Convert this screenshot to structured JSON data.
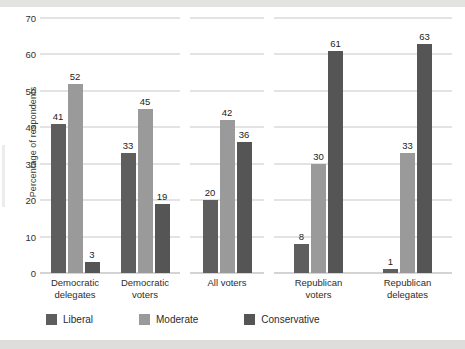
{
  "chart_data": {
    "type": "bar",
    "title": "",
    "xlabel": "",
    "ylabel": "Percentage of respondents",
    "ylim": [
      0,
      70
    ],
    "yticks": [
      0,
      10,
      20,
      30,
      40,
      50,
      60,
      70
    ],
    "grid": true,
    "legend_position": "bottom",
    "categories": [
      "Democratic delegates",
      "Democratic voters",
      "All voters",
      "Republican voters",
      "Republican delegates"
    ],
    "series": [
      {
        "name": "Liberal",
        "color": "#5e5e5e",
        "values": [
          41,
          33,
          20,
          8,
          1
        ]
      },
      {
        "name": "Moderate",
        "color": "#9a9a9a",
        "values": [
          52,
          45,
          42,
          30,
          33
        ]
      },
      {
        "name": "Conservative",
        "color": "#555555",
        "values": [
          3,
          19,
          36,
          61,
          63
        ]
      }
    ],
    "panels": [
      {
        "groups": [
          {
            "label_line1": "Democratic",
            "label_line2": "delegates",
            "values": [
              41,
              52,
              3
            ]
          },
          {
            "label_line1": "Democratic",
            "label_line2": "voters",
            "values": [
              33,
              45,
              19
            ]
          }
        ]
      },
      {
        "groups": [
          {
            "label_line1": "All voters",
            "label_line2": "",
            "values": [
              20,
              42,
              36
            ]
          }
        ]
      },
      {
        "groups": [
          {
            "label_line1": "Republican",
            "label_line2": "voters",
            "values": [
              8,
              30,
              61
            ]
          },
          {
            "label_line1": "Republican",
            "label_line2": "delegates",
            "values": [
              1,
              33,
              63
            ]
          }
        ]
      }
    ]
  },
  "axis": {
    "y_title": "Percentage of respondents",
    "y_tick_labels": [
      "70",
      "60",
      "50",
      "40",
      "30",
      "20",
      "10",
      "0"
    ]
  },
  "legend": {
    "items": [
      {
        "label": "Liberal",
        "color": "#5e5e5e"
      },
      {
        "label": "Moderate",
        "color": "#9a9a9a"
      },
      {
        "label": "Conservative",
        "color": "#555555"
      }
    ]
  }
}
